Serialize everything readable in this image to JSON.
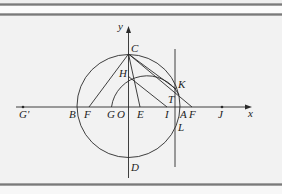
{
  "diagram": {
    "axes": {
      "x_label": "x",
      "y_label": "y"
    },
    "points": {
      "C": "C",
      "H": "H",
      "K": "K",
      "T": "T",
      "L": "L",
      "D": "D",
      "G_prime": "G'",
      "B": "B",
      "F_left": "F",
      "G": "G",
      "O": "O",
      "E": "E",
      "I": "I",
      "A": "A",
      "F_right": "F",
      "J": "J"
    },
    "colors": {
      "stroke": "#2a2a2a",
      "background": "#f2f2f2",
      "rule": "#7a7a7a"
    }
  }
}
